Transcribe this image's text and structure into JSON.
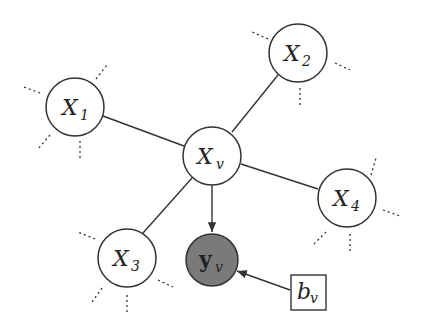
{
  "diagram": {
    "nodes": [
      {
        "id": "X1",
        "label": "X",
        "sub": "1",
        "x": 75,
        "y": 107,
        "type": "latent"
      },
      {
        "id": "X2",
        "label": "X",
        "sub": "2",
        "x": 298,
        "y": 53,
        "type": "latent"
      },
      {
        "id": "Xv",
        "label": "X",
        "sub": "v",
        "x": 212,
        "y": 156,
        "type": "latent"
      },
      {
        "id": "X4",
        "label": "X",
        "sub": "4",
        "x": 347,
        "y": 198,
        "type": "latent"
      },
      {
        "id": "X3",
        "label": "X",
        "sub": "3",
        "x": 127,
        "y": 258,
        "type": "latent"
      },
      {
        "id": "yv",
        "label": "y",
        "sub": "v",
        "x": 212,
        "y": 260,
        "type": "observed"
      },
      {
        "id": "bv",
        "label": "b",
        "sub": "v",
        "x": 308,
        "y": 292,
        "type": "parameter"
      }
    ],
    "edges": [
      {
        "from": "X1",
        "to": "Xv",
        "directed": false
      },
      {
        "from": "X2",
        "to": "Xv",
        "directed": false
      },
      {
        "from": "X4",
        "to": "Xv",
        "directed": false
      },
      {
        "from": "X3",
        "to": "Xv",
        "directed": false
      },
      {
        "from": "Xv",
        "to": "yv",
        "directed": true
      },
      {
        "from": "bv",
        "to": "yv",
        "directed": true
      }
    ],
    "colors": {
      "observed_fill": "#7a7a7a",
      "stroke": "#333333"
    }
  }
}
